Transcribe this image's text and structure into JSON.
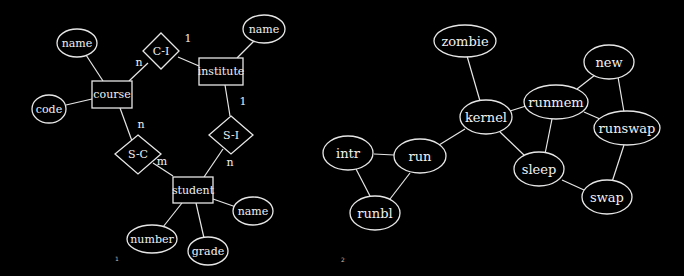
{
  "figures": [
    {
      "id": "er-diagram",
      "caption": "1",
      "entities": [
        {
          "key": "course",
          "label": "course"
        },
        {
          "key": "institute",
          "label": "institute"
        },
        {
          "key": "student",
          "label": "student"
        }
      ],
      "relationships": [
        {
          "key": "ci",
          "label": "C-I"
        },
        {
          "key": "si",
          "label": "S-I"
        },
        {
          "key": "sc",
          "label": "S-C"
        }
      ],
      "attributes": [
        {
          "key": "course_name",
          "label": "name",
          "of": "course"
        },
        {
          "key": "course_code",
          "label": "code",
          "of": "course"
        },
        {
          "key": "institute_name",
          "label": "name",
          "of": "institute"
        },
        {
          "key": "student_name",
          "label": "name",
          "of": "student"
        },
        {
          "key": "student_number",
          "label": "number",
          "of": "student"
        },
        {
          "key": "student_grade",
          "label": "grade",
          "of": "student"
        }
      ],
      "cardinalities": {
        "ci_course": "n",
        "ci_institute": "1",
        "si_institute": "1",
        "si_student": "n",
        "sc_course": "n",
        "sc_student": "m"
      }
    },
    {
      "id": "state-graph",
      "caption": "2",
      "nodes": [
        {
          "key": "zombie",
          "label": "zombie"
        },
        {
          "key": "new",
          "label": "new"
        },
        {
          "key": "runmem",
          "label": "runmem"
        },
        {
          "key": "kernel",
          "label": "kernel"
        },
        {
          "key": "runswap",
          "label": "runswap"
        },
        {
          "key": "intr",
          "label": "intr"
        },
        {
          "key": "run",
          "label": "run"
        },
        {
          "key": "sleep",
          "label": "sleep"
        },
        {
          "key": "swap",
          "label": "swap"
        },
        {
          "key": "runbl",
          "label": "runbl"
        }
      ],
      "edges": [
        [
          "zombie",
          "kernel"
        ],
        [
          "kernel",
          "runmem"
        ],
        [
          "kernel",
          "run"
        ],
        [
          "kernel",
          "sleep"
        ],
        [
          "runmem",
          "new"
        ],
        [
          "runmem",
          "runswap"
        ],
        [
          "runmem",
          "sleep"
        ],
        [
          "new",
          "runswap"
        ],
        [
          "runswap",
          "swap"
        ],
        [
          "sleep",
          "swap"
        ],
        [
          "intr",
          "run"
        ],
        [
          "intr",
          "runbl"
        ],
        [
          "run",
          "runbl"
        ]
      ]
    }
  ]
}
